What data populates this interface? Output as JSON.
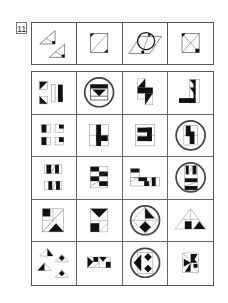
{
  "question": {
    "number": "11"
  },
  "stem": {
    "figures": [
      {
        "id": "stem-1",
        "description": "two right triangles with diagonal, small black corner squares"
      },
      {
        "id": "stem-2",
        "description": "square with diagonal, black corners top-left and bottom-right"
      },
      {
        "id": "stem-3",
        "description": "parallelogram with circle and arrow, black corner"
      },
      {
        "id": "stem-4",
        "description": "square with X diagonals, black corners top-left and bottom-right"
      }
    ]
  },
  "options": {
    "rows": [
      [
        {
          "id": "r1c1",
          "description": "black triangles and vertical bars",
          "circled": false
        },
        {
          "id": "r1c2",
          "description": "square with black band and triangle",
          "circled": true
        },
        {
          "id": "r1c3",
          "description": "stacked black triangles S-shape",
          "circled": false
        },
        {
          "id": "r1c4",
          "description": "L-shape with black triangles",
          "circled": false
        }
      ],
      [
        {
          "id": "r2c1",
          "description": "four small squares with black parts",
          "circled": false
        },
        {
          "id": "r2c2",
          "description": "black T-shape in grid",
          "circled": false
        },
        {
          "id": "r2c3",
          "description": "black C-shape in grid",
          "circled": false
        },
        {
          "id": "r2c4",
          "description": "black step shape in grid",
          "circled": true
        }
      ],
      [
        {
          "id": "r3c1",
          "description": "two bars with black blocks and slash",
          "circled": false
        },
        {
          "id": "r3c2",
          "description": "stacked striped rectangles",
          "circled": false
        },
        {
          "id": "r3c3",
          "description": "step rectangles with black blocks",
          "circled": false
        },
        {
          "id": "r3c4",
          "description": "stacked bars with black blocks",
          "circled": true
        }
      ],
      [
        {
          "id": "r4c1",
          "description": "square with diagonal and black triangle",
          "circled": false
        },
        {
          "id": "r4c2",
          "description": "hourglass black triangles in square",
          "circled": false
        },
        {
          "id": "r4c3",
          "description": "diamond with black triangles",
          "circled": true
        },
        {
          "id": "r4c4",
          "description": "triangle with black square and triangle",
          "circled": false
        }
      ],
      [
        {
          "id": "r5c1",
          "description": "four triangles with black parts",
          "circled": false
        },
        {
          "id": "r5c2",
          "description": "bowtie black triangles row",
          "circled": false
        },
        {
          "id": "r5c3",
          "description": "black diamonds with arrow",
          "circled": true
        },
        {
          "id": "r5c4",
          "description": "black pinwheel shape in square",
          "circled": false
        }
      ]
    ]
  },
  "colors": {
    "ink": "#111111",
    "line": "#555555",
    "circle": "#444444",
    "background": "#ffffff"
  }
}
